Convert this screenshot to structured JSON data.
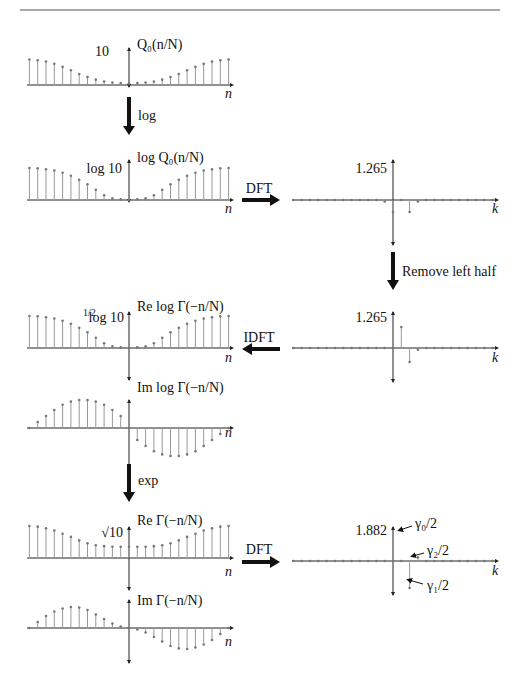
{
  "figure": {
    "steps": {
      "log": "log",
      "dft1": "DFT",
      "remove": "Remove left half",
      "idft": "IDFT",
      "exp": "exp",
      "dft2": "DFT"
    },
    "axes": {
      "n": "n",
      "k": "k"
    },
    "panels": {
      "q0": {
        "title": "Q₀(n/N)",
        "tick": "10"
      },
      "logq0": {
        "title": "log Q₀(n/N)",
        "tick": "log 10"
      },
      "dft_logq0": {
        "tick": "1.265"
      },
      "re_log_gamma": {
        "title": "Re log Γ(−n/N)",
        "tick_frac": "1/2",
        "tick": "log 10"
      },
      "im_log_gamma": {
        "title": "Im log Γ(−n/N)"
      },
      "half_spectrum": {
        "tick": "1.265"
      },
      "re_gamma": {
        "title": "Re Γ(−n/N)",
        "tick": "√10"
      },
      "im_gamma": {
        "title": "Im Γ(−n/N)"
      },
      "gamma_spectrum": {
        "tick": "1.882",
        "annotations": [
          "γ₀/2",
          "γ₂/2",
          "γ₁/2"
        ]
      }
    }
  },
  "chart_data": [
    {
      "type": "stem",
      "id": "q0",
      "title": "Q0(n/N)",
      "xlabel": "n",
      "ytick": "10",
      "values": [
        10,
        9.7,
        9.2,
        8.3,
        7.1,
        5.8,
        4.3,
        3.1,
        2.1,
        1.4,
        1.0,
        0.8,
        0.7,
        0.8,
        1.0,
        1.4,
        2.1,
        3.1,
        4.3,
        5.8,
        7.1,
        8.3,
        9.2,
        9.7,
        10
      ]
    },
    {
      "type": "stem",
      "id": "logq0",
      "title": "log Q0(n/N)",
      "xlabel": "n",
      "ytick": "log 10",
      "values": [
        1.0,
        0.99,
        0.96,
        0.92,
        0.85,
        0.76,
        0.63,
        0.49,
        0.32,
        0.15,
        0.05,
        0.02,
        0,
        0.02,
        0.05,
        0.15,
        0.32,
        0.49,
        0.63,
        0.76,
        0.85,
        0.92,
        0.96,
        0.99,
        1.0
      ]
    },
    {
      "type": "stem",
      "id": "dft_logq0",
      "xlabel": "k",
      "ytick": "1.265",
      "values": [
        0,
        0,
        0,
        0,
        0,
        0,
        0,
        0,
        0,
        0,
        0,
        -0.05,
        -0.4,
        1.265,
        -0.4,
        -0.05,
        0,
        0,
        0,
        0,
        0,
        0,
        0,
        0,
        0
      ]
    },
    {
      "type": "stem",
      "id": "half_spectrum",
      "xlabel": "k",
      "ytick": "1.265",
      "values": [
        0,
        0,
        0,
        0,
        0,
        0,
        0,
        0,
        0,
        0,
        0,
        0,
        0,
        0.6,
        -0.4,
        -0.05,
        0,
        0,
        0,
        0,
        0,
        0,
        0,
        0,
        0
      ]
    },
    {
      "type": "stem",
      "id": "re_log_gamma",
      "title": "Re log Gamma(-n/N)",
      "xlabel": "n",
      "ytick": "1/2 log 10",
      "values": [
        1.0,
        0.99,
        0.96,
        0.92,
        0.85,
        0.76,
        0.63,
        0.49,
        0.32,
        0.15,
        0.05,
        0.02,
        0,
        0.02,
        0.05,
        0.15,
        0.32,
        0.49,
        0.63,
        0.76,
        0.85,
        0.92,
        0.96,
        0.99,
        1.0
      ]
    },
    {
      "type": "stem",
      "id": "im_log_gamma",
      "title": "Im log Gamma(-n/N)",
      "xlabel": "n",
      "values": [
        0,
        0.15,
        0.3,
        0.45,
        0.58,
        0.66,
        0.7,
        0.7,
        0.66,
        0.58,
        0.45,
        0.3,
        0,
        -0.3,
        -0.45,
        -0.58,
        -0.66,
        -0.7,
        -0.7,
        -0.66,
        -0.58,
        -0.45,
        -0.3,
        -0.15,
        0
      ]
    },
    {
      "type": "stem",
      "id": "re_gamma",
      "title": "Re Gamma(-n/N)",
      "xlabel": "n",
      "ytick": "sqrt(10)",
      "values": [
        1.0,
        0.98,
        0.93,
        0.86,
        0.76,
        0.66,
        0.55,
        0.46,
        0.4,
        0.37,
        0.35,
        0.35,
        0.35,
        0.35,
        0.35,
        0.37,
        0.4,
        0.46,
        0.55,
        0.66,
        0.76,
        0.86,
        0.93,
        0.98,
        1.0
      ]
    },
    {
      "type": "stem",
      "id": "im_gamma",
      "title": "Im Gamma(-n/N)",
      "xlabel": "n",
      "values": [
        0,
        0.2,
        0.4,
        0.55,
        0.65,
        0.7,
        0.68,
        0.6,
        0.45,
        0.3,
        0.15,
        0.05,
        0,
        -0.05,
        -0.15,
        -0.3,
        -0.45,
        -0.6,
        -0.68,
        -0.7,
        -0.65,
        -0.55,
        -0.4,
        -0.2,
        0
      ]
    },
    {
      "type": "stem",
      "id": "gamma_spectrum",
      "xlabel": "k",
      "ytick": "1.882",
      "values": [
        0,
        0,
        0,
        0,
        0,
        0,
        0,
        0,
        0,
        0,
        0,
        0,
        0,
        1.882,
        -0.9,
        0.12,
        0,
        0,
        0,
        0,
        0,
        0,
        0,
        0,
        0
      ]
    }
  ]
}
